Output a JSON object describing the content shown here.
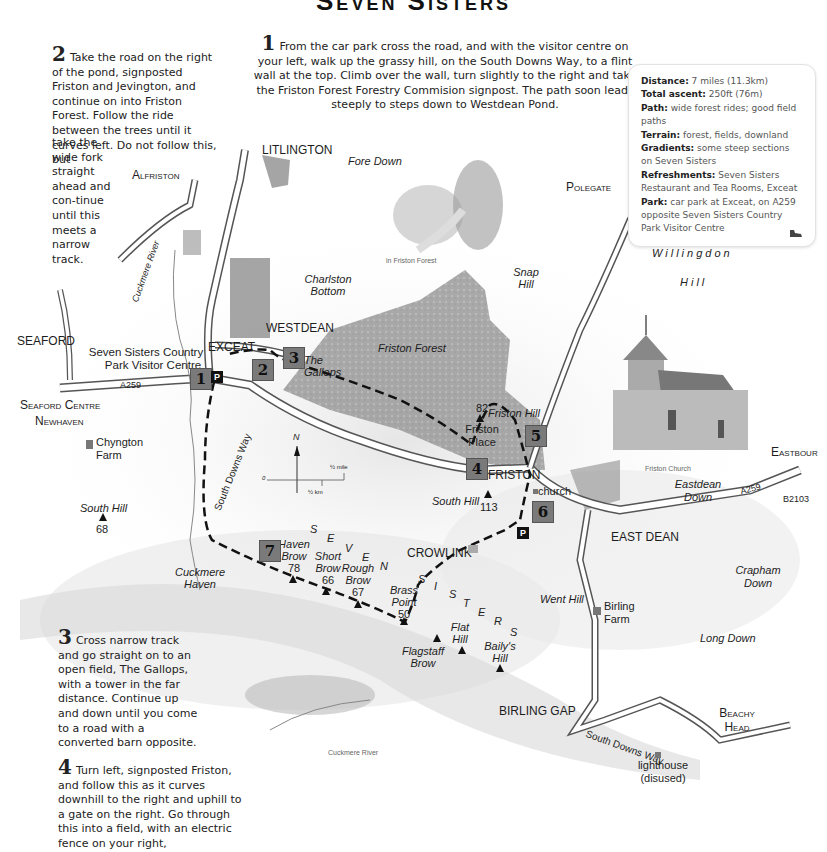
{
  "title": "Seven Sisters",
  "steps": [
    {
      "num": "1",
      "text": "From the car park cross the road, and with the visitor centre on your left, walk up the grassy hill, on the South Downs Way, to a flint wall at the top. Climb over the wall, turn slightly to the right and take the Friston Forest Forestry Commision signpost. The path soon leads steeply to steps down to Westdean Pond."
    },
    {
      "num": "2",
      "text_a": "Take the road on the right of the pond, signposted Friston and Jevington, and continue on into Friston Forest. Follow the ride between the trees until it curves left. Do not follow this, but",
      "text_b": "take the wide fork straight ahead and con-tinue until this meets a narrow track."
    },
    {
      "num": "3",
      "text": "Cross narrow track and go straight on to an open field, The Gallops, with a tower in the far distance. Continue up and down until you come to a road with a converted barn opposite."
    },
    {
      "num": "4",
      "text": "Turn left, signposted Friston, and follow this as it curves downhill to the right and uphill to a gate on the right. Go through this into a field, with an electric fence on your right,"
    }
  ],
  "info": {
    "distance": {
      "label": "Distance:",
      "value": "7 miles (11.3km)"
    },
    "ascent": {
      "label": "Total ascent:",
      "value": "250ft (76m)"
    },
    "path": {
      "label": "Path:",
      "value": "wide forest rides; good field paths"
    },
    "terrain": {
      "label": "Terrain:",
      "value": "forest, fields, downland"
    },
    "gradients": {
      "label": "Gradients:",
      "value": "some steep sections on Seven Sisters"
    },
    "refreshments": {
      "label": "Refreshments:",
      "value": "Seven Sisters Restaurant and Tea Rooms, Exceat"
    },
    "park": {
      "label": "Park:",
      "value": "car park at Exceat, on A259 opposite Seven Sisters Country Park Visitor Centre"
    },
    "icon": "walking-boot-icon"
  },
  "map": {
    "places": {
      "alfriston": "Alfriston",
      "litlington": "LITLINGTON",
      "fore_down": "Fore Down",
      "charlston_bottom_1": "Charlston",
      "charlston_bottom_2": "Bottom",
      "cuckmere_river": "Cuckmere River",
      "seaford": "SEAFORD",
      "visitor_centre_1": "Seven Sisters Country",
      "visitor_centre_2": "Park Visitor Centre",
      "exceat": "EXCEAT",
      "westdean": "WESTDEAN",
      "gallops_1": "The",
      "gallops_2": "Gallops",
      "friston_forest": "Friston Forest",
      "snap_hill_1": "Snap",
      "snap_hill_2": "Hill",
      "polegate": "Polegate",
      "willingdon": "Willingdon",
      "willingdon_hill": "Hill",
      "friston_hill": "Friston Hill",
      "friston_hill_height": "82",
      "friston_place_1": "Friston",
      "friston_place_2": "Place",
      "friston": "FRISTON",
      "church": "church",
      "south_hill_e": "South Hill",
      "south_hill_e_height": "113",
      "eastbourne": "Eastbour",
      "eastdean_down_1": "Eastdean",
      "eastdean_down_2": "Down",
      "a259_e": "A259",
      "b2103": "B2103",
      "east_dean": "EAST DEAN",
      "crowlink": "CROWLINK",
      "crapham_down_1": "Crapham",
      "crapham_down_2": "Down",
      "went_hill": "Went Hill",
      "birling_farm_1": "Birling",
      "birling_farm_2": "Farm",
      "long_down": "Long Down",
      "seaford_centre": "Seaford Centre",
      "newhaven": "Newhaven",
      "a259_w": "A259",
      "chyngton_1": "Chyngton",
      "chyngton_2": "Farm",
      "south_hill_w": "South Hill",
      "south_hill_w_height": "68",
      "south_downs_way_w": "South Downs Way",
      "cuckmere_haven_1": "Cuckmere",
      "cuckmere_haven_2": "Haven",
      "haven_brow_1": "Haven",
      "haven_brow_2": "Brow",
      "haven_brow_h": "78",
      "short_brow_1": "Short",
      "short_brow_2": "Brow",
      "short_brow_h": "66",
      "rough_brow_1": "Rough",
      "rough_brow_2": "Brow",
      "rough_brow_h": "67",
      "brass_point_1": "Brass",
      "brass_point_2": "Point",
      "brass_point_h": "50",
      "flagstaff_1": "Flagstaff",
      "flagstaff_2": "Brow",
      "flat_hill_1": "Flat",
      "flat_hill_2": "Hill",
      "bailys_1": "Baily's",
      "bailys_2": "Hill",
      "birling_gap": "BIRLING GAP",
      "south_downs_way_e": "South Downs Way",
      "beachy_1": "Beachy",
      "beachy_2": "Head",
      "lighthouse_1": "lighthouse",
      "lighthouse_2": "(disused)"
    },
    "seven_sisters_letters": [
      "S",
      "E",
      "V",
      "E",
      "N",
      "S",
      "I",
      "S",
      "T",
      "E",
      "R",
      "S"
    ],
    "captions": {
      "forest": "in Friston Forest",
      "church": "Friston Church",
      "river": "Cuckmere River"
    },
    "markers": [
      "1",
      "2",
      "3",
      "4",
      "5",
      "6",
      "7"
    ],
    "parking": "P",
    "scale": {
      "zero": "0",
      "mile": "½ mile",
      "km": "½ km",
      "north": "N"
    }
  }
}
